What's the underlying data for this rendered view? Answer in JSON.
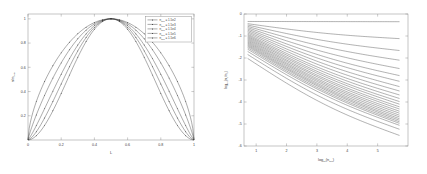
{
  "figure": {
    "panel_count": 2,
    "background_color": "#ffffff",
    "axis_color": "#8a8a8a",
    "curve_color": "#2a2a2a"
  },
  "chart_data": [
    {
      "type": "line",
      "panel": "left",
      "title": "",
      "xlabel": "L",
      "ylabel": "n/n_peak",
      "xlim": [
        0,
        1
      ],
      "ylim": [
        0,
        1.04
      ],
      "grid": false,
      "xticks": [
        "0",
        "0.2",
        "0.4",
        "0.6",
        "0.8",
        "1"
      ],
      "xtick_values": [
        0,
        0.2,
        0.4,
        0.6,
        0.8,
        1
      ],
      "yticks": [
        "0.2",
        "0.4",
        "0.6",
        "0.8",
        "1"
      ],
      "ytick_values": [
        0.2,
        0.4,
        0.6,
        0.8,
        1.0
      ],
      "markers": "dot",
      "legend_position": "upper-right",
      "legend_title": "",
      "series": [
        {
          "name": "n_sep = 1.5e2",
          "var": "n",
          "var_sub": "sep",
          "value": "1.5e2",
          "exponent": 2,
          "shape_power": 0.62,
          "x": [
            0,
            0.05,
            0.1,
            0.15,
            0.2,
            0.25,
            0.3,
            0.35,
            0.4,
            0.45,
            0.5,
            0.55,
            0.6,
            0.65,
            0.7,
            0.75,
            0.8,
            0.85,
            0.9,
            0.95,
            1
          ],
          "values": [
            0.0,
            0.258,
            0.438,
            0.582,
            0.7,
            0.796,
            0.874,
            0.932,
            0.972,
            0.994,
            1.0,
            0.994,
            0.972,
            0.932,
            0.874,
            0.796,
            0.7,
            0.582,
            0.438,
            0.258,
            0.0
          ]
        },
        {
          "name": "n_sep = 1.5e3",
          "var": "n",
          "var_sub": "sep",
          "value": "1.5e3",
          "exponent": 3,
          "shape_power": 0.85,
          "x": [
            0,
            0.05,
            0.1,
            0.15,
            0.2,
            0.25,
            0.3,
            0.35,
            0.4,
            0.45,
            0.5,
            0.55,
            0.6,
            0.65,
            0.7,
            0.75,
            0.8,
            0.85,
            0.9,
            0.95,
            1
          ],
          "values": [
            0.0,
            0.182,
            0.342,
            0.484,
            0.61,
            0.718,
            0.81,
            0.884,
            0.94,
            0.98,
            1.0,
            0.98,
            0.94,
            0.884,
            0.81,
            0.718,
            0.61,
            0.484,
            0.342,
            0.182,
            0.0
          ]
        },
        {
          "name": "n_sep = 1.5e4",
          "var": "n",
          "var_sub": "sep",
          "value": "1.5e4",
          "exponent": 4,
          "shape_power": 1.15,
          "x": [
            0,
            0.05,
            0.1,
            0.15,
            0.2,
            0.25,
            0.3,
            0.35,
            0.4,
            0.45,
            0.5,
            0.55,
            0.6,
            0.65,
            0.7,
            0.75,
            0.8,
            0.85,
            0.9,
            0.95,
            1
          ],
          "values": [
            0.0,
            0.122,
            0.256,
            0.39,
            0.52,
            0.64,
            0.748,
            0.84,
            0.914,
            0.968,
            1.0,
            0.968,
            0.914,
            0.84,
            0.748,
            0.64,
            0.52,
            0.39,
            0.256,
            0.122,
            0.0
          ]
        },
        {
          "name": "n_sep = 1.5e5",
          "var": "n",
          "var_sub": "sep",
          "value": "1.5e5",
          "exponent": 5,
          "shape_power": 1.45,
          "x": [
            0,
            0.05,
            0.1,
            0.15,
            0.2,
            0.25,
            0.3,
            0.35,
            0.4,
            0.45,
            0.5,
            0.55,
            0.6,
            0.65,
            0.7,
            0.75,
            0.8,
            0.85,
            0.9,
            0.95,
            1
          ],
          "values": [
            0.0,
            0.086,
            0.196,
            0.318,
            0.446,
            0.572,
            0.692,
            0.798,
            0.886,
            0.954,
            1.0,
            0.954,
            0.886,
            0.798,
            0.692,
            0.572,
            0.446,
            0.318,
            0.196,
            0.086,
            0.0
          ]
        },
        {
          "name": "n_sep = 1.5e6",
          "var": "n",
          "var_sub": "sep",
          "value": "1.5e6",
          "exponent": 6,
          "shape_power": 1.8,
          "x": [
            0,
            0.05,
            0.1,
            0.15,
            0.2,
            0.25,
            0.3,
            0.35,
            0.4,
            0.45,
            0.5,
            0.55,
            0.6,
            0.65,
            0.7,
            0.75,
            0.8,
            0.85,
            0.9,
            0.95,
            1
          ],
          "values": [
            0.0,
            0.06,
            0.148,
            0.256,
            0.378,
            0.506,
            0.634,
            0.754,
            0.856,
            0.938,
            1.0,
            0.938,
            0.856,
            0.754,
            0.634,
            0.506,
            0.378,
            0.256,
            0.148,
            0.06,
            0.0
          ]
        }
      ]
    },
    {
      "type": "line",
      "panel": "right",
      "title": "",
      "xlabel": "log10(n_sep)",
      "ylabel": "log10(n_c / n_0)",
      "xlim": [
        0.6,
        6.0
      ],
      "ylim": [
        -6.0,
        0.0
      ],
      "grid": false,
      "xticks": [
        "1",
        "2",
        "3",
        "4",
        "5"
      ],
      "xtick_values": [
        1,
        2,
        3,
        4,
        5
      ],
      "yticks": [
        "0",
        "-1",
        "-2",
        "-3",
        "-4",
        "-5",
        "-6"
      ],
      "ytick_values": [
        0,
        -1,
        -2,
        -3,
        -4,
        -5,
        -6
      ],
      "legend_position": "none",
      "curve_count": 26,
      "note": "dense fan of monotonically decreasing curves, flat top curve near y=-0.35",
      "series": [
        {
          "name": "curve-01",
          "y_start": -0.34,
          "y_end": -0.35,
          "curvature": 0.0
        },
        {
          "name": "curve-02",
          "y_start": -0.44,
          "y_end": -1.12,
          "curvature": 0.1
        },
        {
          "name": "curve-03",
          "y_start": -0.5,
          "y_end": -1.66,
          "curvature": 0.14
        },
        {
          "name": "curve-04",
          "y_start": -0.56,
          "y_end": -2.1,
          "curvature": 0.17
        },
        {
          "name": "curve-05",
          "y_start": -0.62,
          "y_end": -2.48,
          "curvature": 0.19
        },
        {
          "name": "curve-06",
          "y_start": -0.68,
          "y_end": -2.8,
          "curvature": 0.21
        },
        {
          "name": "curve-07",
          "y_start": -0.74,
          "y_end": -3.06,
          "curvature": 0.22
        },
        {
          "name": "curve-08",
          "y_start": -0.8,
          "y_end": -3.3,
          "curvature": 0.23
        },
        {
          "name": "curve-09",
          "y_start": -0.86,
          "y_end": -3.5,
          "curvature": 0.24
        },
        {
          "name": "curve-10",
          "y_start": -0.92,
          "y_end": -3.68,
          "curvature": 0.25
        },
        {
          "name": "curve-11",
          "y_start": -0.97,
          "y_end": -3.84,
          "curvature": 0.25
        },
        {
          "name": "curve-12",
          "y_start": -1.02,
          "y_end": -3.98,
          "curvature": 0.26
        },
        {
          "name": "curve-13",
          "y_start": -1.07,
          "y_end": -4.1,
          "curvature": 0.26
        },
        {
          "name": "curve-14",
          "y_start": -1.12,
          "y_end": -4.22,
          "curvature": 0.27
        },
        {
          "name": "curve-15",
          "y_start": -1.17,
          "y_end": -4.32,
          "curvature": 0.27
        },
        {
          "name": "curve-16",
          "y_start": -1.22,
          "y_end": -4.42,
          "curvature": 0.28
        },
        {
          "name": "curve-17",
          "y_start": -1.27,
          "y_end": -4.51,
          "curvature": 0.28
        },
        {
          "name": "curve-18",
          "y_start": -1.32,
          "y_end": -4.6,
          "curvature": 0.28
        },
        {
          "name": "curve-19",
          "y_start": -1.37,
          "y_end": -4.68,
          "curvature": 0.29
        },
        {
          "name": "curve-20",
          "y_start": -1.42,
          "y_end": -4.76,
          "curvature": 0.29
        },
        {
          "name": "curve-21",
          "y_start": -1.47,
          "y_end": -4.83,
          "curvature": 0.29
        },
        {
          "name": "curve-22",
          "y_start": -1.53,
          "y_end": -4.9,
          "curvature": 0.3
        },
        {
          "name": "curve-23",
          "y_start": -1.6,
          "y_end": -4.97,
          "curvature": 0.3
        },
        {
          "name": "curve-24",
          "y_start": -1.7,
          "y_end": -5.06,
          "curvature": 0.31
        },
        {
          "name": "curve-25",
          "y_start": -1.84,
          "y_end": -5.24,
          "curvature": 0.33
        },
        {
          "name": "curve-26",
          "y_start": -2.02,
          "y_end": -5.52,
          "curvature": 0.35
        }
      ]
    }
  ]
}
